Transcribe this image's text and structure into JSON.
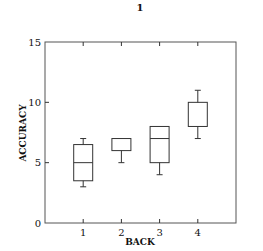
{
  "chart_data": {
    "type": "boxplot",
    "title": "1",
    "xlabel": "BACK",
    "ylabel": "ACCURACY",
    "xlim": [
      0,
      5
    ],
    "ylim": [
      0,
      15
    ],
    "xticks": [
      1,
      2,
      3,
      4
    ],
    "yticks": [
      0,
      5,
      10,
      15
    ],
    "grid": false,
    "categories": [
      "1",
      "2",
      "3",
      "4"
    ],
    "boxes": [
      {
        "x": 1,
        "whisker_low": 3,
        "q1": 3.5,
        "median": 5,
        "q3": 6.5,
        "whisker_high": 7
      },
      {
        "x": 2,
        "whisker_low": 5,
        "q1": 6,
        "median": 6,
        "q3": 7,
        "whisker_high": 7
      },
      {
        "x": 3,
        "whisker_low": 4,
        "q1": 5,
        "median": 7,
        "q3": 8,
        "whisker_high": 8
      },
      {
        "x": 4,
        "whisker_low": 7,
        "q1": 8,
        "median": 8,
        "q3": 10,
        "whisker_high": 11
      }
    ],
    "colors": {
      "line": "#333333",
      "frame": "#555555"
    }
  },
  "labels": {
    "title": "1",
    "xlabel": "BACK",
    "ylabel": "ACCURACY",
    "xtick_labels": [
      "1",
      "2",
      "3",
      "4"
    ],
    "ytick_labels": [
      "0",
      "5",
      "10",
      "15"
    ]
  }
}
